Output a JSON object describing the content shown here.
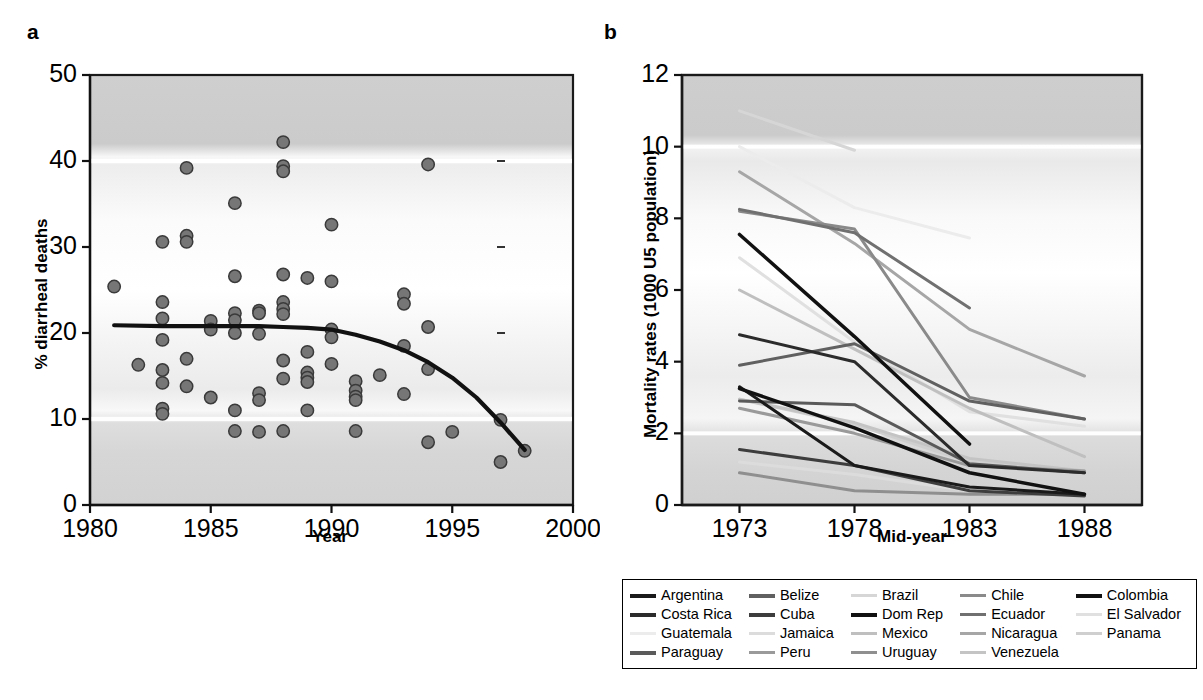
{
  "figure": {
    "panel_a_letter": "a",
    "panel_b_letter": "b"
  },
  "chart_data": [
    {
      "id": "panel_a",
      "type": "scatter",
      "title": "",
      "xlabel": "Year",
      "ylabel": "% diarrheal deaths",
      "xlim": [
        1980,
        2000
      ],
      "ylim": [
        0,
        50
      ],
      "xticks": [
        1980,
        1985,
        1990,
        1995,
        2000
      ],
      "yticks": [
        0,
        10,
        20,
        30,
        40,
        50
      ],
      "grid": false,
      "legend_position": "none",
      "points": [
        {
          "x": 1981.0,
          "y": 25.4
        },
        {
          "x": 1982.0,
          "y": 16.3
        },
        {
          "x": 1983.0,
          "y": 30.6
        },
        {
          "x": 1983.0,
          "y": 23.6
        },
        {
          "x": 1983.0,
          "y": 21.7
        },
        {
          "x": 1983.0,
          "y": 19.2
        },
        {
          "x": 1983.0,
          "y": 15.7
        },
        {
          "x": 1983.0,
          "y": 14.2
        },
        {
          "x": 1983.0,
          "y": 11.2
        },
        {
          "x": 1983.0,
          "y": 10.6
        },
        {
          "x": 1984.0,
          "y": 39.2
        },
        {
          "x": 1984.0,
          "y": 31.3
        },
        {
          "x": 1984.0,
          "y": 30.6
        },
        {
          "x": 1984.0,
          "y": 17.0
        },
        {
          "x": 1984.0,
          "y": 13.8
        },
        {
          "x": 1985.0,
          "y": 21.4
        },
        {
          "x": 1985.0,
          "y": 20.4
        },
        {
          "x": 1985.0,
          "y": 12.5
        },
        {
          "x": 1986.0,
          "y": 35.1
        },
        {
          "x": 1986.0,
          "y": 26.6
        },
        {
          "x": 1986.0,
          "y": 22.3
        },
        {
          "x": 1986.0,
          "y": 21.5
        },
        {
          "x": 1986.0,
          "y": 20.0
        },
        {
          "x": 1986.0,
          "y": 11.0
        },
        {
          "x": 1986.0,
          "y": 8.6
        },
        {
          "x": 1987.0,
          "y": 22.6
        },
        {
          "x": 1987.0,
          "y": 22.3
        },
        {
          "x": 1987.0,
          "y": 19.9
        },
        {
          "x": 1987.0,
          "y": 13.0
        },
        {
          "x": 1987.0,
          "y": 12.2
        },
        {
          "x": 1987.0,
          "y": 8.5
        },
        {
          "x": 1988.0,
          "y": 42.2
        },
        {
          "x": 1988.0,
          "y": 39.4
        },
        {
          "x": 1988.0,
          "y": 38.8
        },
        {
          "x": 1988.0,
          "y": 26.8
        },
        {
          "x": 1988.0,
          "y": 23.6
        },
        {
          "x": 1988.0,
          "y": 22.8
        },
        {
          "x": 1988.0,
          "y": 22.2
        },
        {
          "x": 1988.0,
          "y": 16.8
        },
        {
          "x": 1988.0,
          "y": 14.7
        },
        {
          "x": 1988.0,
          "y": 8.6
        },
        {
          "x": 1989.0,
          "y": 26.4
        },
        {
          "x": 1989.0,
          "y": 17.8
        },
        {
          "x": 1989.0,
          "y": 15.4
        },
        {
          "x": 1989.0,
          "y": 14.8
        },
        {
          "x": 1989.0,
          "y": 14.3
        },
        {
          "x": 1989.0,
          "y": 11.0
        },
        {
          "x": 1990.0,
          "y": 32.6
        },
        {
          "x": 1990.0,
          "y": 26.0
        },
        {
          "x": 1990.0,
          "y": 20.4
        },
        {
          "x": 1990.0,
          "y": 19.5
        },
        {
          "x": 1990.0,
          "y": 16.4
        },
        {
          "x": 1991.0,
          "y": 14.4
        },
        {
          "x": 1991.0,
          "y": 13.3
        },
        {
          "x": 1991.0,
          "y": 12.6
        },
        {
          "x": 1991.0,
          "y": 12.2
        },
        {
          "x": 1991.0,
          "y": 8.6
        },
        {
          "x": 1992.0,
          "y": 15.1
        },
        {
          "x": 1993.0,
          "y": 24.5
        },
        {
          "x": 1993.0,
          "y": 23.4
        },
        {
          "x": 1993.0,
          "y": 18.5
        },
        {
          "x": 1993.0,
          "y": 12.9
        },
        {
          "x": 1994.0,
          "y": 39.6
        },
        {
          "x": 1994.0,
          "y": 20.7
        },
        {
          "x": 1994.0,
          "y": 15.8
        },
        {
          "x": 1994.0,
          "y": 7.3
        },
        {
          "x": 1995.0,
          "y": 8.5
        },
        {
          "x": 1997.0,
          "y": 9.9
        },
        {
          "x": 1997.0,
          "y": 5.0
        },
        {
          "x": 1998.0,
          "y": 6.3
        }
      ],
      "trend_line": {
        "name": "lowess fit",
        "x": [
          1981.0,
          1983.0,
          1985.0,
          1987.0,
          1988.0,
          1989.0,
          1990.0,
          1991.0,
          1992.0,
          1993.0,
          1994.0,
          1995.0,
          1996.0,
          1997.0,
          1998.0
        ],
        "y": [
          20.9,
          20.8,
          20.8,
          20.8,
          20.7,
          20.6,
          20.4,
          19.8,
          19.0,
          18.0,
          16.6,
          14.8,
          12.5,
          9.6,
          6.4
        ]
      },
      "right_axis_ticks": [
        40,
        30,
        20,
        10
      ]
    },
    {
      "id": "panel_b",
      "type": "line",
      "title": "",
      "xlabel": "Mid-year",
      "ylabel": "Mortality rates (1000 U5 population)",
      "xlim": [
        1970.5,
        1990.5
      ],
      "ylim": [
        0,
        12
      ],
      "x": [
        1973,
        1978,
        1983,
        1988
      ],
      "xticks": [
        1973,
        1978,
        1983,
        1988
      ],
      "yticks": [
        0,
        2,
        4,
        6,
        8,
        10,
        12
      ],
      "grid": false,
      "legend_position": "below",
      "series": [
        {
          "name": "Argentina",
          "color": "#1a1a1a",
          "width": 3.0,
          "values": [
            3.3,
            1.1,
            0.5,
            0.3
          ]
        },
        {
          "name": "Belize",
          "color": "#606060",
          "width": 3.0,
          "values": [
            3.9,
            4.5,
            2.9,
            2.4
          ]
        },
        {
          "name": "Brazil",
          "color": "#d6d6d6",
          "width": 3.0,
          "values": [
            11.0,
            9.9,
            null,
            null
          ]
        },
        {
          "name": "Chile",
          "color": "#8a8a8a",
          "width": 3.0,
          "values": [
            8.2,
            7.7,
            3.0,
            2.4
          ]
        },
        {
          "name": "Colombia",
          "color": "#111111",
          "width": 3.5,
          "values": [
            7.55,
            4.7,
            1.7,
            null
          ]
        },
        {
          "name": "Costa Rica",
          "color": "#2b2b2b",
          "width": 3.0,
          "values": [
            4.75,
            4.0,
            1.1,
            0.9
          ]
        },
        {
          "name": "Cuba",
          "color": "#3d3d3d",
          "width": 3.0,
          "values": [
            1.55,
            1.1,
            0.4,
            0.25
          ]
        },
        {
          "name": "Dom Rep",
          "color": "#111111",
          "width": 3.5,
          "values": [
            3.25,
            2.15,
            0.9,
            0.3
          ]
        },
        {
          "name": "Ecuador",
          "color": "#707070",
          "width": 3.0,
          "values": [
            8.25,
            7.6,
            5.5,
            null
          ]
        },
        {
          "name": "El Salvador",
          "color": "#e0e0e0",
          "width": 3.0,
          "values": [
            6.9,
            4.55,
            2.6,
            2.2
          ]
        },
        {
          "name": "Guatemala",
          "color": "#ececec",
          "width": 3.0,
          "values": [
            10.0,
            8.3,
            7.45,
            null
          ]
        },
        {
          "name": "Jamaica",
          "color": "#dcdcdc",
          "width": 3.0,
          "values": [
            1.2,
            0.85,
            0.4,
            0.25
          ]
        },
        {
          "name": "Mexico",
          "color": "#bfbfbf",
          "width": 3.0,
          "values": [
            6.0,
            4.35,
            2.7,
            1.35
          ]
        },
        {
          "name": "Nicaragua",
          "color": "#a6a6a6",
          "width": 3.0,
          "values": [
            9.3,
            7.3,
            4.9,
            3.6
          ]
        },
        {
          "name": "Panama",
          "color": "#cfcfcf",
          "width": 3.0,
          "values": [
            2.95,
            2.25,
            1.2,
            0.95
          ]
        },
        {
          "name": "Paraguay",
          "color": "#5a5a5a",
          "width": 3.0,
          "values": [
            2.9,
            2.8,
            1.15,
            0.9
          ]
        },
        {
          "name": "Peru",
          "color": "#9a9a9a",
          "width": 3.0,
          "values": [
            2.7,
            2.0,
            1.1,
            0.95
          ]
        },
        {
          "name": "Uruguay",
          "color": "#8f8f8f",
          "width": 3.0,
          "values": [
            0.9,
            0.4,
            0.3,
            0.3
          ]
        },
        {
          "name": "Venezuela",
          "color": "#c4c4c4",
          "width": 3.0,
          "values": [
            2.95,
            2.3,
            1.3,
            0.95
          ]
        }
      ]
    }
  ],
  "legend": {
    "columns": 5,
    "rows": 4,
    "entries": [
      {
        "label": "Argentina",
        "color": "#1a1a1a",
        "thick": true
      },
      {
        "label": "Belize",
        "color": "#606060",
        "thick": true
      },
      {
        "label": "Brazil",
        "color": "#d6d6d6",
        "thick": false
      },
      {
        "label": "Chile",
        "color": "#8a8a8a",
        "thick": false
      },
      {
        "label": "Colombia",
        "color": "#111111",
        "thick": true
      },
      {
        "label": "Costa Rica",
        "color": "#2b2b2b",
        "thick": true
      },
      {
        "label": "Cuba",
        "color": "#3d3d3d",
        "thick": true
      },
      {
        "label": "Dom Rep",
        "color": "#111111",
        "thick": true
      },
      {
        "label": "Ecuador",
        "color": "#707070",
        "thick": false
      },
      {
        "label": "El Salvador",
        "color": "#e0e0e0",
        "thick": false
      },
      {
        "label": "Guatemala",
        "color": "#ececec",
        "thick": false
      },
      {
        "label": "Jamaica",
        "color": "#dcdcdc",
        "thick": false
      },
      {
        "label": "Mexico",
        "color": "#bfbfbf",
        "thick": false
      },
      {
        "label": "Nicaragua",
        "color": "#a6a6a6",
        "thick": false
      },
      {
        "label": "Panama",
        "color": "#cfcfcf",
        "thick": false
      },
      {
        "label": "Paraguay",
        "color": "#5a5a5a",
        "thick": true
      },
      {
        "label": "Peru",
        "color": "#9a9a9a",
        "thick": false
      },
      {
        "label": "Uruguay",
        "color": "#8f8f8f",
        "thick": false
      },
      {
        "label": "Venezuela",
        "color": "#c4c4c4",
        "thick": false
      },
      {
        "label": "",
        "color": "transparent",
        "thick": false
      }
    ]
  }
}
